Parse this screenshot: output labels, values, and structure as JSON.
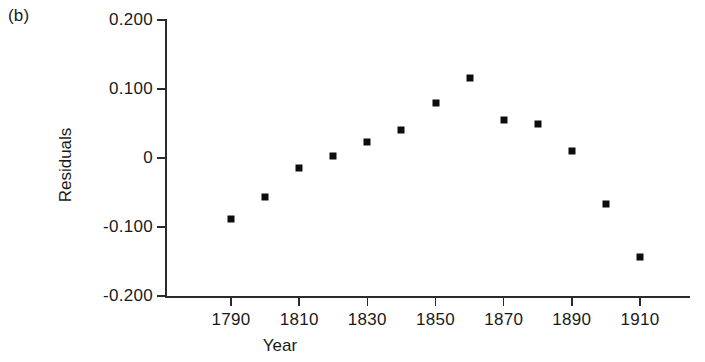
{
  "figure": {
    "panel_label": "(b)"
  },
  "chart_data": {
    "type": "scatter",
    "title": "",
    "xlabel": "Year",
    "ylabel": "Residuals",
    "xlim": [
      1780,
      1920
    ],
    "ylim": [
      -0.2,
      0.2
    ],
    "grid": false,
    "legend": null,
    "marker": "filled-square",
    "marker_color": "#0d0d0d",
    "x": [
      1790,
      1800,
      1810,
      1820,
      1830,
      1840,
      1850,
      1860,
      1870,
      1880,
      1890,
      1900,
      1910
    ],
    "values": [
      -0.089,
      -0.057,
      -0.015,
      0.003,
      0.023,
      0.04,
      0.079,
      0.116,
      0.055,
      0.049,
      0.01,
      -0.066,
      -0.144
    ],
    "xticks": [
      1790,
      1810,
      1830,
      1850,
      1870,
      1890,
      1910
    ],
    "xticklabels": [
      "1790",
      "1810",
      "1830",
      "1850",
      "1870",
      "1890",
      "1910"
    ],
    "yticks": [
      0.2,
      0.1,
      0,
      -0.1,
      -0.2
    ],
    "yticklabels": [
      "0.200",
      "0.100",
      "0",
      "-0.100",
      "-0.200"
    ]
  }
}
